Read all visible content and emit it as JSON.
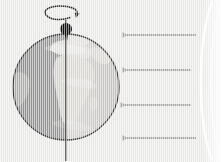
{
  "diagram": {
    "title": "Earth rotation and sunlight illumination diagram",
    "caption": "Day and night hemispheres of a rotating Earth lit by parallel rays from the Sun",
    "background_color": "#eceae8",
    "canvas": {
      "width": 220,
      "height": 162
    }
  },
  "earth": {
    "label": "Earth globe",
    "center_x": 66,
    "center_y": 87,
    "radius": 53,
    "outline_color": "#3b3b3b",
    "day_side_label": "Day side (illuminated hemisphere)",
    "night_side_label": "Night side (shadowed hemisphere)",
    "day_color": "#d8d6d2",
    "night_color": "#9a9a98",
    "landmass_label": "Africa and Europe land masses",
    "land_color": "#cfcdc7"
  },
  "axis": {
    "label": "Rotation axis",
    "color": "#4a4a4a",
    "top_y": 20,
    "bottom_y": 161,
    "x": 66
  },
  "north_pole": {
    "label": "North pole marker",
    "color": "#111111",
    "cx": 66,
    "cy": 29,
    "r": 6
  },
  "rotation_indicator": {
    "label": "Rotation direction arrow",
    "color": "#2d2d2d",
    "cx": 64,
    "cy": 14,
    "rx": 13,
    "ry": 5.5,
    "direction": "counterclockwise viewed from north"
  },
  "sunlight": {
    "label": "Sunlight rays",
    "arrow_color": "#a8a8a8",
    "direction": "right to left",
    "count": 4,
    "rays": [
      {
        "name": "ray-1",
        "y": 35,
        "x_start": 196,
        "x_end": 120
      },
      {
        "name": "ray-2",
        "y": 70,
        "x_start": 191,
        "x_end": 120
      },
      {
        "name": "ray-3",
        "y": 105,
        "x_start": 191,
        "x_end": 118
      },
      {
        "name": "ray-4",
        "y": 138,
        "x_start": 196,
        "x_end": 120
      }
    ]
  },
  "sun": {
    "label": "Sun limb arc",
    "arc_color": "#ffffff",
    "glow_color": "#f4f3f1",
    "edge_x": 209
  },
  "terminator": {
    "label": "Day/night terminator line"
  }
}
